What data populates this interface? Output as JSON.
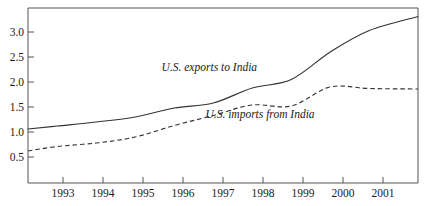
{
  "chart_data": {
    "type": "line",
    "title": "",
    "subtitle": "",
    "xlabel": "",
    "ylabel": "",
    "grid": false,
    "legend_position": "inline-annotation",
    "xlim": [
      1992.25,
      2002.25
    ],
    "ylim": [
      0.0,
      3.5
    ],
    "y_ticks": [
      0.5,
      1.0,
      1.5,
      2.0,
      2.5,
      3.0
    ],
    "y_tick_labels": [
      "0.5",
      "1.0",
      "1.5",
      "2.0",
      "2.5",
      "3.0"
    ],
    "x_ticks": [
      1993,
      1994,
      1995,
      1996,
      1997,
      1998,
      1999,
      2000,
      2001
    ],
    "x_tick_labels": [
      "1993",
      "1994",
      "1995",
      "1996",
      "1997",
      "1998",
      "1999",
      "2000",
      "2001"
    ],
    "x": [
      1992.25,
      1993,
      1994,
      1995,
      1996,
      1997,
      1998,
      1999,
      2000,
      2001,
      2002.25
    ],
    "series": [
      {
        "name": "U.S. exports to India",
        "style": "solid",
        "annotation": "U.S. exports to India",
        "annotation_x": 1996.9,
        "annotation_y": 2.24,
        "values": [
          1.08,
          1.14,
          1.22,
          1.32,
          1.5,
          1.6,
          1.9,
          2.07,
          2.62,
          3.05,
          3.33
        ]
      },
      {
        "name": "U.S. imports from India",
        "style": "dashed",
        "annotation": "U.S. imports from India",
        "annotation_x": 1998.2,
        "annotation_y": 1.3,
        "values": [
          0.64,
          0.73,
          0.8,
          0.92,
          1.15,
          1.35,
          1.56,
          1.54,
          1.92,
          1.89,
          1.88
        ]
      }
    ]
  },
  "axis": {
    "y_tick_0": "0.5",
    "y_tick_1": "1.0",
    "y_tick_2": "1.5",
    "y_tick_3": "2.0",
    "y_tick_4": "2.5",
    "y_tick_5": "3.0",
    "x_tick_0": "1993",
    "x_tick_1": "1994",
    "x_tick_2": "1995",
    "x_tick_3": "1996",
    "x_tick_4": "1997",
    "x_tick_5": "1998",
    "x_tick_6": "1999",
    "x_tick_7": "2000",
    "x_tick_8": "2001"
  },
  "annotations": {
    "exports_label": "U.S. exports to India",
    "imports_label": "U.S. imports from India"
  },
  "colors": {
    "line": "#333333",
    "axis": "#555555",
    "text": "#1a1a1a",
    "background": "#ffffff"
  }
}
